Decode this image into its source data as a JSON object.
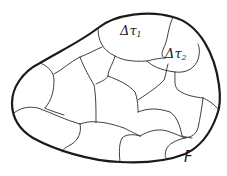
{
  "figure": {
    "type": "region-partition-diagram",
    "region_label": "F",
    "cell_labels": [
      {
        "symbol": "Δτ",
        "subscript": "1"
      },
      {
        "symbol": "Δτ",
        "subscript": "2"
      }
    ],
    "colors": {
      "outline": "#1a1a1a",
      "cell_lines": "#2a2a2a",
      "background": "#ffffff"
    }
  }
}
